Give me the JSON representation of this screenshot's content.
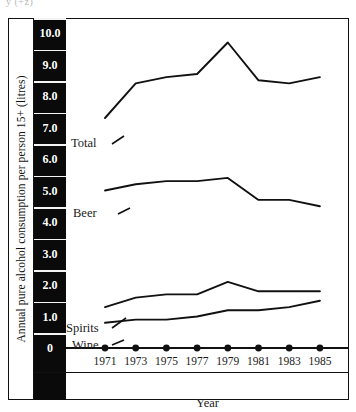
{
  "figure": {
    "scan_top_text": "y (+z)",
    "y_axis_title": "Annual pure alcohol consumption per person 15+ (litres)",
    "x_axis_title": "Year"
  },
  "axis": {
    "y_ticks": [
      "10.0",
      "9.0",
      "8.0",
      "7.0",
      "6.0",
      "5.0",
      "4.0",
      "3.0",
      "2.0",
      "1.0",
      "0"
    ],
    "x_ticks": [
      "1971",
      "1973",
      "1975",
      "1977",
      "1979",
      "1981",
      "1983",
      "1985"
    ]
  },
  "series_labels": {
    "total": "Total",
    "beer": "Beer",
    "spirits": "Spirits",
    "wine": "Wine"
  },
  "colors": {
    "ink": "#111111",
    "tick_column_bg": "#0a0a0a",
    "tick_column_text": "#ffffff",
    "paper": "#ffffff"
  },
  "chart_data": {
    "type": "line",
    "title": "",
    "xlabel": "Year",
    "ylabel": "Annual pure alcohol consumption per person 15+ (litres)",
    "x": [
      1971,
      1973,
      1975,
      1977,
      1979,
      1981,
      1983,
      1985
    ],
    "xlim": [
      1970,
      1986
    ],
    "ylim": [
      0,
      10
    ],
    "yticks": [
      0,
      1,
      2,
      3,
      4,
      5,
      6,
      7,
      8,
      9,
      10
    ],
    "grid": false,
    "legend": "inline-labels",
    "series": [
      {
        "name": "Total",
        "values": [
          7.3,
          8.4,
          8.6,
          8.7,
          9.7,
          8.5,
          8.4,
          8.6
        ]
      },
      {
        "name": "Beer",
        "values": [
          5.0,
          5.2,
          5.3,
          5.3,
          5.4,
          4.7,
          4.7,
          4.5
        ]
      },
      {
        "name": "Spirits",
        "values": [
          1.3,
          1.6,
          1.7,
          1.7,
          2.1,
          1.8,
          1.8,
          1.8
        ]
      },
      {
        "name": "Wine",
        "values": [
          0.8,
          0.9,
          0.9,
          1.0,
          1.2,
          1.2,
          1.3,
          1.5
        ]
      }
    ],
    "marker_row_note": "Solid round markers are drawn on the x-axis baseline at each year tick."
  }
}
